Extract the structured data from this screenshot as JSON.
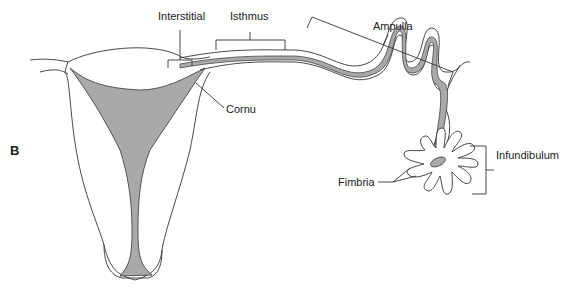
{
  "figure": {
    "panel_label": "B"
  },
  "labels": {
    "interstitial": "Interstitial",
    "isthmus": "Isthmus",
    "ampulla": "Ampulla",
    "cornu": "Cornu",
    "infundibulum": "Infundibulum",
    "fimbria": "Fimbria"
  },
  "colors": {
    "outline": "#333333",
    "lumen_fill": "#a9a9a9",
    "background": "#ffffff"
  }
}
